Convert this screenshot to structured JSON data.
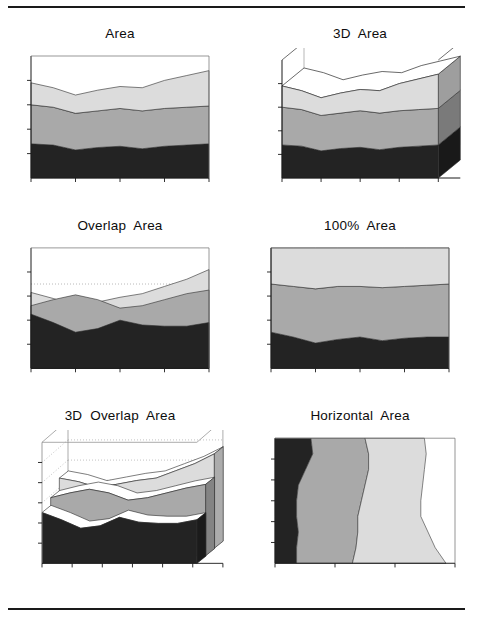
{
  "page": {
    "rules": {
      "top_label": "top-divider",
      "bottom_label": "bottom-divider"
    },
    "background": "#ffffff",
    "ink": "#000000"
  },
  "palette": {
    "series_dark": "#232323",
    "series_mid": "#a9a9a9",
    "series_light": "#dcdcdc",
    "series_light_side": "#c9c9c9",
    "series_mid_side": "#8d8d8d",
    "series_dark_side": "#141414",
    "axis": "#1a1a1a",
    "grid_dotted": "#9a9a9a",
    "cage": "#8a8a8a"
  },
  "panels": [
    {
      "id": "area",
      "title": "Area"
    },
    {
      "id": "area3d",
      "title": "3D  Area"
    },
    {
      "id": "overlap",
      "title": "Overlap  Area"
    },
    {
      "id": "pct100",
      "title": "100%  Area"
    },
    {
      "id": "overlap3d",
      "title": "3D  Overlap  Area"
    },
    {
      "id": "horizontal",
      "title": "Horizontal  Area"
    }
  ],
  "chart_data": [
    {
      "type": "area",
      "id": "area",
      "title": "Area",
      "stacked": true,
      "categories": [
        1,
        2,
        3,
        4,
        5,
        6,
        7,
        8,
        9
      ],
      "x": [
        0,
        0.125,
        0.25,
        0.375,
        0.5,
        0.625,
        0.75,
        0.875,
        1
      ],
      "series": [
        {
          "name": "Series 1",
          "color": "#232323",
          "values": [
            28,
            27,
            23,
            25,
            26,
            24,
            26,
            27,
            28
          ]
        },
        {
          "name": "Series 2",
          "color": "#a9a9a9",
          "values": [
            32,
            31,
            30,
            30,
            31,
            31,
            31,
            31,
            31
          ]
        },
        {
          "name": "Series 3",
          "color": "#dcdcdc",
          "values": [
            18,
            16,
            15,
            17,
            18,
            19,
            23,
            26,
            29
          ]
        }
      ],
      "ylim": [
        0,
        100
      ],
      "xlabel": "",
      "ylabel": "",
      "grid": false,
      "x_ticks": 5,
      "y_ticks": 4,
      "legend": "none"
    },
    {
      "type": "area",
      "id": "area3d",
      "title": "3D  Area",
      "stacked": true,
      "three_d": true,
      "depth_x": 22,
      "depth_y": 18,
      "categories": [
        1,
        2,
        3,
        4,
        5,
        6,
        7,
        8,
        9
      ],
      "x": [
        0,
        0.125,
        0.25,
        0.375,
        0.5,
        0.625,
        0.75,
        0.875,
        1
      ],
      "series": [
        {
          "name": "Series 1",
          "color": "#232323",
          "values": [
            28,
            27,
            23,
            25,
            26,
            24,
            26,
            27,
            28
          ]
        },
        {
          "name": "Series 2",
          "color": "#a9a9a9",
          "values": [
            32,
            31,
            30,
            30,
            31,
            31,
            31,
            31,
            31
          ]
        },
        {
          "name": "Series 3",
          "color": "#dcdcdc",
          "values": [
            18,
            16,
            15,
            17,
            18,
            19,
            23,
            26,
            29
          ]
        }
      ],
      "ylim": [
        0,
        100
      ],
      "grid": false,
      "x_ticks": 5,
      "y_ticks": 4,
      "legend": "none"
    },
    {
      "type": "area",
      "id": "overlap",
      "title": "Overlap  Area",
      "stacked": false,
      "overlap": true,
      "categories": [
        1,
        2,
        3,
        4,
        5,
        6,
        7,
        8,
        9
      ],
      "x": [
        0,
        0.125,
        0.25,
        0.375,
        0.5,
        0.625,
        0.75,
        0.875,
        1
      ],
      "series": [
        {
          "name": "Series 3",
          "color": "#dcdcdc",
          "values": [
            63,
            58,
            52,
            55,
            59,
            62,
            68,
            74,
            82
          ]
        },
        {
          "name": "Series 2",
          "color": "#a9a9a9",
          "values": [
            52,
            57,
            61,
            57,
            50,
            52,
            57,
            62,
            65
          ]
        },
        {
          "name": "Series 1",
          "color": "#232323",
          "values": [
            45,
            38,
            30,
            33,
            40,
            36,
            35,
            35,
            38
          ]
        }
      ],
      "ylim": [
        0,
        100
      ],
      "grid": true,
      "grid_style": "dotted",
      "grid_levels": [
        70
      ],
      "x_ticks": 5,
      "y_ticks": 4,
      "legend": "none"
    },
    {
      "type": "area",
      "id": "pct100",
      "title": "100%  Area",
      "stacked": true,
      "normalized": true,
      "categories": [
        1,
        2,
        3,
        4,
        5,
        6,
        7,
        8,
        9
      ],
      "x": [
        0,
        0.125,
        0.25,
        0.375,
        0.5,
        0.625,
        0.75,
        0.875,
        1
      ],
      "series": [
        {
          "name": "Series 1",
          "color": "#232323",
          "values": [
            30,
            26,
            21,
            24,
            26,
            23,
            25,
            26,
            26
          ]
        },
        {
          "name": "Series 2",
          "color": "#a9a9a9",
          "values": [
            40,
            42,
            45,
            44,
            42,
            44,
            43,
            43,
            44
          ]
        },
        {
          "name": "Series 3",
          "color": "#dcdcdc",
          "values": [
            30,
            32,
            34,
            32,
            32,
            33,
            32,
            31,
            30
          ]
        }
      ],
      "ylim": [
        0,
        100
      ],
      "grid": false,
      "x_ticks": 5,
      "y_ticks": 4,
      "legend": "none"
    },
    {
      "type": "area",
      "id": "overlap3d",
      "title": "3D  Overlap  Area",
      "three_d": true,
      "ribbons": true,
      "depth_x": 26,
      "depth_y": 22,
      "categories": [
        1,
        2,
        3,
        4,
        5,
        6,
        7,
        8,
        9
      ],
      "x": [
        0,
        0.125,
        0.25,
        0.375,
        0.5,
        0.625,
        0.75,
        0.875,
        1
      ],
      "series": [
        {
          "name": "Series 3",
          "color": "#dcdcdc",
          "values": [
            58,
            55,
            50,
            53,
            56,
            58,
            64,
            70,
            78
          ]
        },
        {
          "name": "Series 2",
          "color": "#a9a9a9",
          "values": [
            48,
            52,
            55,
            52,
            46,
            48,
            52,
            56,
            59
          ]
        },
        {
          "name": "Series 1",
          "color": "#232323",
          "values": [
            42,
            36,
            29,
            31,
            38,
            34,
            33,
            33,
            36
          ]
        }
      ],
      "ylim": [
        0,
        100
      ],
      "grid": true,
      "grid_style": "dotted",
      "x_ticks": 7,
      "y_ticks": 5,
      "legend": "none"
    },
    {
      "type": "area",
      "id": "horizontal",
      "title": "Horizontal  Area",
      "orientation": "horizontal",
      "stacked": true,
      "categories": [
        1,
        2,
        3,
        4,
        5,
        6,
        7,
        8,
        9
      ],
      "x": [
        0,
        0.125,
        0.25,
        0.375,
        0.5,
        0.625,
        0.75,
        0.875,
        1
      ],
      "series": [
        {
          "name": "Series 1",
          "color": "#232323",
          "values": [
            20,
            21,
            17,
            13,
            12,
            12,
            13,
            12,
            12
          ]
        },
        {
          "name": "Series 2",
          "color": "#a9a9a9",
          "values": [
            30,
            31,
            35,
            37,
            36,
            34,
            33,
            33,
            31
          ]
        },
        {
          "name": "Series 3",
          "color": "#dcdcdc",
          "values": [
            33,
            32,
            31,
            32,
            33,
            35,
            39,
            44,
            52
          ]
        }
      ],
      "ylim": [
        0,
        100
      ],
      "grid": false,
      "x_ticks": 4,
      "y_ticks": 5,
      "legend": "none"
    }
  ]
}
